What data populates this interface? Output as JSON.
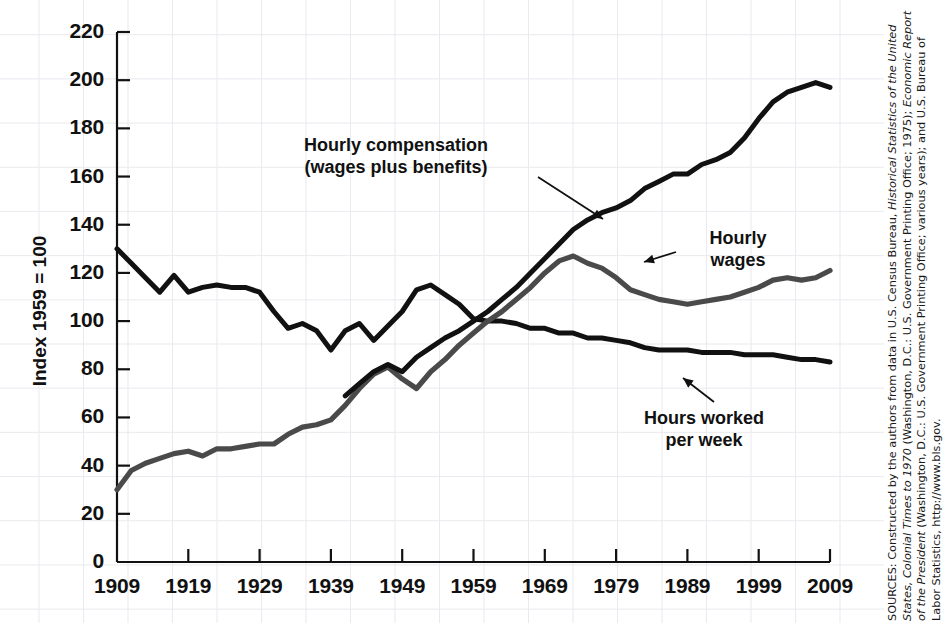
{
  "chart_data": {
    "type": "line",
    "title": "",
    "xlabel": "",
    "ylabel": "Index 1959 = 100",
    "xlim": [
      1909,
      2009
    ],
    "ylim": [
      0,
      220
    ],
    "grid": true,
    "legend_position": "inline-annotations",
    "yticks": [
      0,
      20,
      40,
      60,
      80,
      100,
      120,
      140,
      160,
      180,
      200,
      220
    ],
    "xticks": [
      1909,
      1919,
      1929,
      1939,
      1949,
      1959,
      1969,
      1979,
      1989,
      1999,
      2009
    ],
    "series": [
      {
        "name": "Hours worked per week",
        "color": "#111111",
        "x": [
          1909,
          1911,
          1913,
          1915,
          1917,
          1919,
          1921,
          1923,
          1925,
          1927,
          1929,
          1931,
          1933,
          1935,
          1937,
          1939,
          1941,
          1943,
          1945,
          1947,
          1949,
          1951,
          1953,
          1955,
          1957,
          1959,
          1961,
          1963,
          1965,
          1967,
          1969,
          1971,
          1973,
          1975,
          1977,
          1979,
          1981,
          1983,
          1985,
          1987,
          1989,
          1991,
          1993,
          1995,
          1997,
          1999,
          2001,
          2003,
          2005,
          2007,
          2009
        ],
        "values": [
          130,
          124,
          118,
          112,
          119,
          112,
          114,
          115,
          114,
          114,
          112,
          104,
          97,
          99,
          96,
          88,
          96,
          99,
          92,
          98,
          104,
          113,
          115,
          111,
          107,
          101,
          100,
          100,
          99,
          97,
          97,
          95,
          95,
          93,
          93,
          92,
          91,
          89,
          88,
          88,
          88,
          87,
          87,
          87,
          86,
          86,
          86,
          85,
          84,
          84,
          83
        ]
      },
      {
        "name": "Hourly wages",
        "color": "#4a4a4a",
        "x": [
          1909,
          1911,
          1913,
          1915,
          1917,
          1919,
          1921,
          1923,
          1925,
          1927,
          1929,
          1931,
          1933,
          1935,
          1937,
          1939,
          1941,
          1943,
          1945,
          1947,
          1949,
          1951,
          1953,
          1955,
          1957,
          1959,
          1961,
          1963,
          1965,
          1967,
          1969,
          1971,
          1973,
          1975,
          1977,
          1979,
          1981,
          1983,
          1985,
          1987,
          1989,
          1991,
          1993,
          1995,
          1997,
          1999,
          2001,
          2003,
          2005,
          2007,
          2009
        ],
        "values": [
          30,
          38,
          41,
          43,
          45,
          46,
          44,
          47,
          47,
          48,
          49,
          49,
          53,
          56,
          57,
          59,
          65,
          72,
          78,
          81,
          76,
          72,
          79,
          84,
          90,
          95,
          100,
          104,
          109,
          114,
          120,
          125,
          127,
          124,
          122,
          118,
          113,
          111,
          109,
          108,
          107,
          108,
          109,
          110,
          112,
          114,
          117,
          118,
          117,
          118,
          121
        ]
      },
      {
        "name": "Hourly compensation (wages plus benefits)",
        "color": "#111111",
        "x": [
          1941,
          1943,
          1945,
          1947,
          1949,
          1951,
          1953,
          1955,
          1957,
          1959,
          1961,
          1963,
          1965,
          1967,
          1969,
          1971,
          1973,
          1975,
          1977,
          1979,
          1981,
          1983,
          1985,
          1987,
          1989,
          1991,
          1993,
          1995,
          1997,
          1999,
          2001,
          2003,
          2005,
          2007,
          2009
        ],
        "values": [
          69,
          74,
          79,
          82,
          79,
          85,
          89,
          93,
          96,
          100,
          104,
          109,
          114,
          120,
          126,
          132,
          138,
          142,
          145,
          147,
          150,
          155,
          158,
          161,
          161,
          165,
          167,
          170,
          176,
          184,
          191,
          195,
          197,
          199,
          197
        ]
      }
    ],
    "annotations": [
      {
        "name": "hourly-compensation",
        "text": "Hourly compensation\n(wages plus benefits)",
        "x": 1922,
        "y": 170
      },
      {
        "name": "hourly-wages",
        "text": "Hourly\nwages",
        "x": 1982,
        "y": 133
      },
      {
        "name": "hours-worked",
        "text": "Hours worked\nper week",
        "x": 1977,
        "y": 62
      }
    ]
  },
  "axis": {
    "y_title": "Index 1959 = 100",
    "y_labels": [
      "220",
      "200",
      "180",
      "160",
      "140",
      "120",
      "100",
      "80",
      "60",
      "40",
      "20",
      "0"
    ],
    "x_labels": [
      "1909",
      "1919",
      "1929",
      "1939",
      "1949",
      "1959",
      "1969",
      "1979",
      "1989",
      "1999",
      "2009"
    ]
  },
  "annotations": {
    "compensation": "Hourly compensation\n(wages plus benefits)",
    "wages": "Hourly\nwages",
    "hours": "Hours worked\nper week"
  },
  "source": {
    "prefix": "SOURCES: Constructed by the authors from data in U.S. Census Bureau, ",
    "italic1": "Historical Statistics of the United States, Colonial Times to 1970",
    "mid1": " (Washington, D.C.: U.S. Government Printing Office; 1975); ",
    "italic2": "Economic Report of the President",
    "mid2": " (Washington, D.C.: U.S. Government Printing Office; various years); and U.S. Bureau of Labor Statistics, http://www.bls.gov.",
    "full": "SOURCES: Constructed by the authors from data in U.S. Census Bureau, Historical Statistics of the United States, Colonial Times to 1970 (Washington, D.C.: U.S. Government Printing Office; 1975); Economic Report of the President (Washington, D.C.: U.S. Government Printing Office; various years); and U.S. Bureau of Labor Statistics, http://www.bls.gov."
  },
  "colors": {
    "axis": "#111111",
    "grid": "#e9e9ef",
    "line_dark": "#111111",
    "line_gray": "#4a4a4a",
    "background": "#ffffff"
  }
}
